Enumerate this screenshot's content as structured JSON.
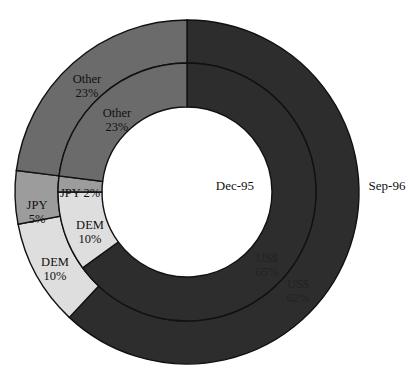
{
  "chart_data": {
    "type": "pie",
    "subtype": "doughnut",
    "title": "",
    "rings": [
      {
        "name": "Dec-95",
        "position": "inner",
        "slices": [
          {
            "label": "US$",
            "value": 65,
            "display": "65%"
          },
          {
            "label": "DEM",
            "value": 10,
            "display": "10%"
          },
          {
            "label": "JPY",
            "value": 2,
            "display": "2%"
          },
          {
            "label": "Other",
            "value": 23,
            "display": "23%"
          }
        ]
      },
      {
        "name": "Sep-96",
        "position": "outer",
        "slices": [
          {
            "label": "US$",
            "value": 62,
            "display": "62%"
          },
          {
            "label": "DEM",
            "value": 10,
            "display": "10%"
          },
          {
            "label": "JPY",
            "value": 5,
            "display": "5%"
          },
          {
            "label": "Other",
            "value": 23,
            "display": "23%"
          }
        ]
      }
    ],
    "colors": {
      "US$": "#2d2d2d",
      "DEM": "#dedede",
      "JPY": "#9c9c9c",
      "Other": "#6b6b6b"
    },
    "start_angle": 0,
    "direction": "clockwise",
    "legend": "none"
  },
  "labels": {
    "inner_ring": "Dec-95",
    "outer_ring": "Sep-96",
    "inner": {
      "usd": {
        "name": "US$",
        "pct": "65%"
      },
      "dem": {
        "name": "DEM",
        "pct": "10%"
      },
      "jpy": {
        "text": "JPY 2%"
      },
      "other": {
        "name": "Other",
        "pct": "23%"
      }
    },
    "outer": {
      "usd": {
        "name": "US$",
        "pct": "62%"
      },
      "dem": {
        "name": "DEM",
        "pct": "10%"
      },
      "jpy": {
        "name": "JPY",
        "pct": "5%"
      },
      "other": {
        "name": "Other",
        "pct": "23%"
      }
    }
  }
}
